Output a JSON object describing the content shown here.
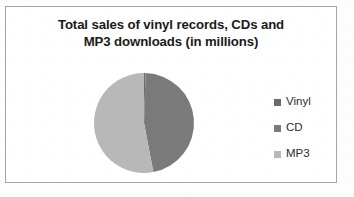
{
  "chart_data": {
    "type": "pie",
    "title": "Total sales of vinyl records, CDs and MP3 downloads (in millions)",
    "title_line1": "Total sales of vinyl records, CDs and",
    "title_line2": "MP3 downloads (in millions)",
    "categories": [
      "Vinyl",
      "CD",
      "MP3"
    ],
    "values": [
      0.5,
      46.5,
      53
    ],
    "slices": [
      {
        "label": "Vinyl",
        "value": 0.5,
        "percent": 0.5,
        "start_angle": 0,
        "end_angle": 1.8,
        "color": "#6b6b6b"
      },
      {
        "label": "CD",
        "value": 46.5,
        "percent": 46.5,
        "start_angle": 1.8,
        "end_angle": 169.2,
        "color": "#7a7a7a"
      },
      {
        "label": "MP3",
        "value": 53,
        "percent": 53,
        "start_angle": 169.2,
        "end_angle": 360,
        "color": "#b8b8b8"
      }
    ],
    "legend": {
      "position": "right",
      "entries": [
        {
          "label": "Vinyl",
          "color": "#6b6b6b"
        },
        {
          "label": "CD",
          "color": "#7a7a7a"
        },
        {
          "label": "MP3",
          "color": "#b8b8b8"
        }
      ]
    },
    "grid": false,
    "xlabel": "",
    "ylabel": "",
    "units": "millions",
    "data_labels_shown": false,
    "geometry": {
      "center_x": 60,
      "center_y": 60,
      "radius": 50
    }
  },
  "frame": {
    "border_color": "#a6a6a6",
    "background": "#ffffff"
  }
}
